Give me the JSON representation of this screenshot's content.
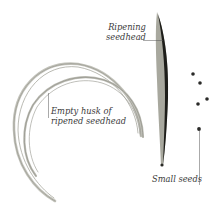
{
  "labels": {
    "ripening_seedhead": [
      "Ripening",
      "seedhead"
    ],
    "empty_husk": [
      "Empty husk of",
      "ripened seedhead"
    ],
    "small_seeds": "Small seeds"
  },
  "colors": {
    "background": "#ffffff",
    "husk": "#b8b8b0",
    "husk_dark": "#8e8e86",
    "seedhead_dark": "#1e1e1a",
    "seedhead_light": "#9a9a90",
    "seed": "#2a2a28",
    "leader_line": "#555555",
    "text": "#3a3a3a"
  },
  "seeds": [
    {
      "x": 193,
      "y": 74
    },
    {
      "x": 200,
      "y": 83
    },
    {
      "x": 207,
      "y": 99
    },
    {
      "x": 198,
      "y": 104
    },
    {
      "x": 199,
      "y": 129
    }
  ]
}
